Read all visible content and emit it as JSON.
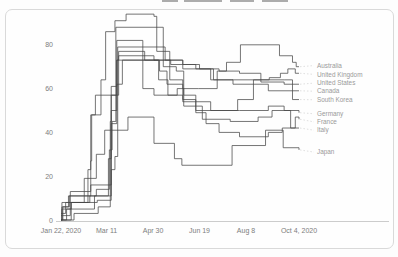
{
  "figure": {
    "type": "line-chart-figure",
    "border_color": "#d9d9d9",
    "line_color": "#474747",
    "tick_label_color": "#7d7d7d",
    "legend_label_color": "#9a9a9a",
    "axis_line_color": "#cccccc"
  },
  "chart_data": {
    "type": "line",
    "subtype": "step-after",
    "title": "",
    "xlabel": "",
    "ylabel": "",
    "x_unit": "days since Jan 22, 2020",
    "x_tick_days": [
      0,
      49,
      99,
      149,
      199,
      256
    ],
    "x_tick_labels": [
      "Jan 22, 2020",
      "Mar 11",
      "Apr 30",
      "Jun 19",
      "Aug 8",
      "Oct 4, 2020"
    ],
    "y_tick_labels": [
      "0",
      "20",
      "40",
      "60",
      "80"
    ],
    "y_ticks": [
      0,
      20,
      40,
      60,
      80
    ],
    "xlim": [
      0,
      256
    ],
    "ylim": [
      0,
      97
    ],
    "grid": false,
    "legend_position": "right-of-line-endpoints",
    "series": [
      {
        "name": "Australia",
        "label_value": 70.5,
        "points": [
          [
            0,
            0
          ],
          [
            1,
            8
          ],
          [
            10,
            13
          ],
          [
            32,
            16
          ],
          [
            54,
            44
          ],
          [
            60,
            62
          ],
          [
            66,
            73
          ],
          [
            106,
            68
          ],
          [
            114,
            62
          ],
          [
            131,
            60
          ],
          [
            148,
            60
          ],
          [
            168,
            68
          ],
          [
            178,
            72
          ],
          [
            193,
            80
          ],
          [
            235,
            75
          ],
          [
            249,
            72
          ],
          [
            253,
            70
          ],
          [
            256,
            70
          ]
        ]
      },
      {
        "name": "United Kingdom",
        "label_value": 66.5,
        "points": [
          [
            0,
            0
          ],
          [
            11,
            8
          ],
          [
            31,
            11
          ],
          [
            54,
            23
          ],
          [
            58,
            29
          ],
          [
            61,
            79
          ],
          [
            112,
            73
          ],
          [
            131,
            71
          ],
          [
            145,
            69
          ],
          [
            164,
            64
          ],
          [
            183,
            64
          ],
          [
            224,
            65
          ],
          [
            236,
            67
          ],
          [
            244,
            69
          ],
          [
            252,
            67
          ],
          [
            256,
            67
          ]
        ]
      },
      {
        "name": "United States",
        "label_value": 62.5,
        "points": [
          [
            0,
            0
          ],
          [
            1,
            5
          ],
          [
            11,
            8
          ],
          [
            39,
            9
          ],
          [
            54,
            61
          ],
          [
            60,
            73
          ],
          [
            118,
            71
          ],
          [
            131,
            69
          ],
          [
            149,
            69
          ],
          [
            170,
            68
          ],
          [
            192,
            67
          ],
          [
            215,
            63
          ],
          [
            240,
            62
          ],
          [
            256,
            62
          ]
        ]
      },
      {
        "name": "Canada",
        "label_value": 58.8,
        "points": [
          [
            0,
            0
          ],
          [
            14,
            3
          ],
          [
            40,
            6
          ],
          [
            53,
            45
          ],
          [
            54,
            57
          ],
          [
            62,
            75
          ],
          [
            100,
            73
          ],
          [
            131,
            71
          ],
          [
            149,
            69
          ],
          [
            161,
            64
          ],
          [
            185,
            62
          ],
          [
            223,
            59
          ],
          [
            256,
            59
          ]
        ]
      },
      {
        "name": "South Korea",
        "label_value": 54.9,
        "points": [
          [
            0,
            3
          ],
          [
            5,
            8
          ],
          [
            29,
            23
          ],
          [
            32,
            48
          ],
          [
            37,
            57
          ],
          [
            60,
            82
          ],
          [
            88,
            60
          ],
          [
            100,
            57
          ],
          [
            131,
            54
          ],
          [
            161,
            50
          ],
          [
            190,
            55
          ],
          [
            207,
            64
          ],
          [
            240,
            64
          ],
          [
            249,
            55
          ],
          [
            256,
            55
          ]
        ]
      },
      {
        "name": "Germany",
        "label_value": 48.5,
        "points": [
          [
            0,
            0
          ],
          [
            6,
            5
          ],
          [
            36,
            11
          ],
          [
            51,
            28
          ],
          [
            54,
            50
          ],
          [
            60,
            73
          ],
          [
            62,
            77
          ],
          [
            90,
            73
          ],
          [
            105,
            64
          ],
          [
            115,
            57
          ],
          [
            125,
            60
          ],
          [
            132,
            57
          ],
          [
            145,
            50
          ],
          [
            192,
            50
          ],
          [
            223,
            52
          ],
          [
            240,
            50
          ],
          [
            256,
            49
          ]
        ]
      },
      {
        "name": "France",
        "label_value": 44.8,
        "points": [
          [
            0,
            0
          ],
          [
            2,
            6
          ],
          [
            8,
            11
          ],
          [
            38,
            14
          ],
          [
            52,
            32
          ],
          [
            55,
            45
          ],
          [
            59,
            88
          ],
          [
            110,
            70
          ],
          [
            124,
            68
          ],
          [
            132,
            52
          ],
          [
            152,
            46
          ],
          [
            182,
            45
          ],
          [
            212,
            47
          ],
          [
            227,
            50
          ],
          [
            247,
            42
          ],
          [
            252,
            47
          ],
          [
            256,
            46
          ]
        ]
      },
      {
        "name": "Italy",
        "label_value": 41.0,
        "points": [
          [
            0,
            0
          ],
          [
            1,
            6
          ],
          [
            9,
            11
          ],
          [
            32,
            27
          ],
          [
            33,
            48
          ],
          [
            43,
            64
          ],
          [
            48,
            86
          ],
          [
            58,
            91
          ],
          [
            70,
            94
          ],
          [
            100,
            93
          ],
          [
            103,
            77
          ],
          [
            117,
            64
          ],
          [
            131,
            55
          ],
          [
            145,
            49
          ],
          [
            156,
            44
          ],
          [
            170,
            40
          ],
          [
            192,
            38
          ],
          [
            223,
            40
          ],
          [
            238,
            42
          ],
          [
            256,
            42
          ]
        ]
      },
      {
        "name": "Japan",
        "label_value": 31.0,
        "points": [
          [
            0,
            2
          ],
          [
            10,
            8
          ],
          [
            25,
            19
          ],
          [
            38,
            30
          ],
          [
            47,
            41
          ],
          [
            72,
            47
          ],
          [
            100,
            35
          ],
          [
            122,
            28
          ],
          [
            130,
            25
          ],
          [
            184,
            34
          ],
          [
            220,
            41
          ],
          [
            239,
            33
          ],
          [
            256,
            32
          ]
        ]
      }
    ]
  }
}
